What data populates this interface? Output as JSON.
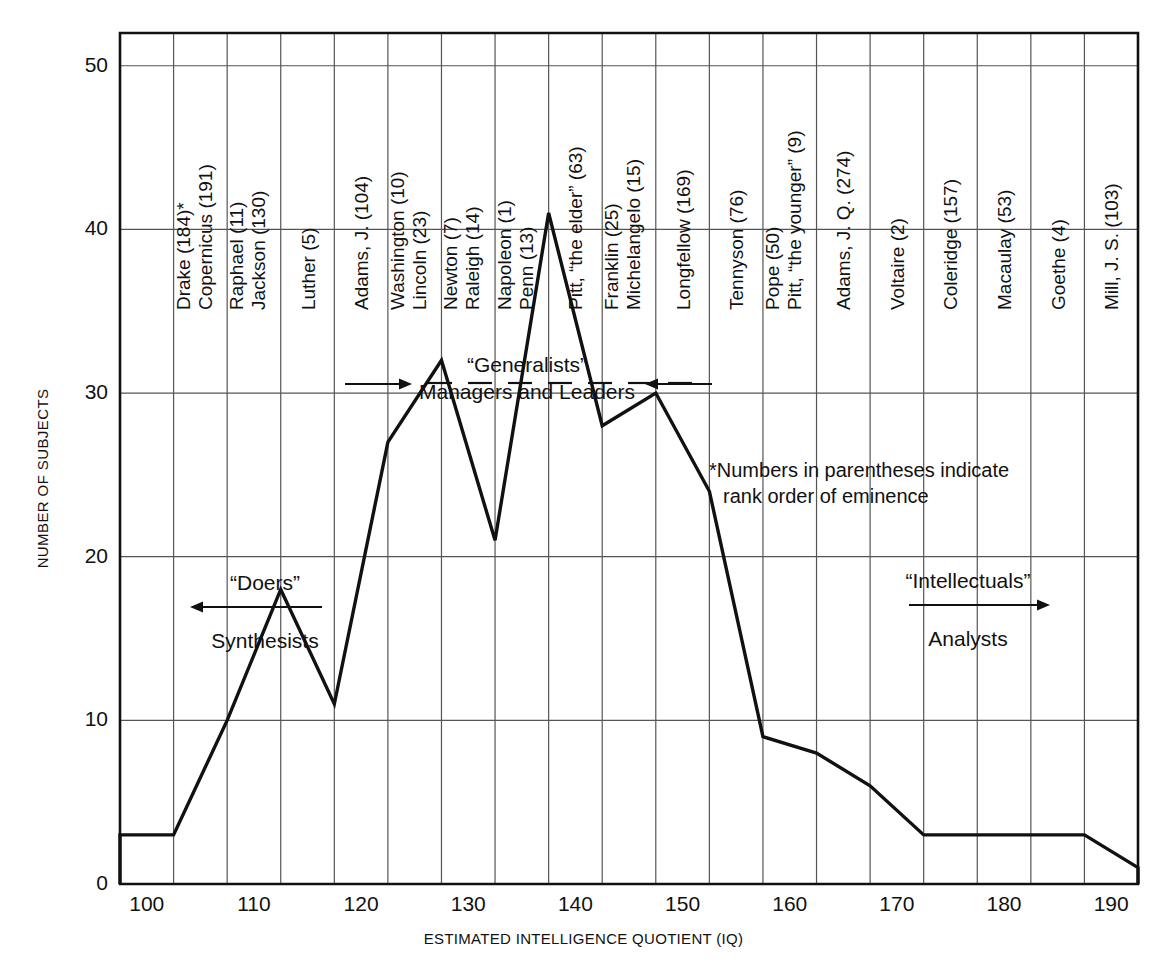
{
  "chart_data": {
    "type": "bar",
    "title": "",
    "xlabel": "ESTIMATED INTELLIGENCE QUOTIENT (IQ)",
    "ylabel": "NUMBER OF SUBJECTS",
    "xlim": [
      97.5,
      192.5
    ],
    "ylim": [
      0,
      52
    ],
    "xticks": [
      100,
      110,
      120,
      130,
      140,
      150,
      160,
      170,
      180,
      190
    ],
    "yticks": [
      0,
      10,
      20,
      30,
      40,
      50
    ],
    "grid": true,
    "legend": "none",
    "bin_width": 5,
    "bin_starts": [
      97.5,
      102.5,
      107.5,
      112.5,
      117.5,
      122.5,
      127.5,
      132.5,
      137.5,
      142.5,
      147.5,
      152.5,
      157.5,
      162.5,
      167.5,
      172.5,
      177.5,
      182.5,
      187.5
    ],
    "values": [
      3,
      10,
      18,
      11,
      27,
      32,
      21,
      41,
      28,
      30,
      24,
      9,
      8,
      6,
      3,
      3,
      3,
      3,
      1
    ]
  },
  "axis": {
    "y_label": "NUMBER OF SUBJECTS",
    "x_label": "ESTIMATED INTELLIGENCE QUOTIENT (IQ)",
    "y_ticks": [
      "0",
      "10",
      "20",
      "30",
      "40",
      "50"
    ],
    "x_ticks": [
      "100",
      "110",
      "120",
      "130",
      "140",
      "150",
      "160",
      "170",
      "180",
      "190"
    ]
  },
  "column_labels": [
    {
      "bin_start": 102.5,
      "lines": [
        "Drake (184)*",
        "Copernicus (191)"
      ]
    },
    {
      "bin_start": 107.5,
      "lines": [
        "Raphael (11)",
        "Jackson (130)"
      ]
    },
    {
      "bin_start": 112.5,
      "lines": [
        "Luther (5)"
      ]
    },
    {
      "bin_start": 117.5,
      "lines": [
        "Adams, J. (104)"
      ]
    },
    {
      "bin_start": 122.5,
      "lines": [
        "Washington (10)",
        "Lincoln (23)"
      ]
    },
    {
      "bin_start": 127.5,
      "lines": [
        "Newton (7)",
        "Raleigh (14)"
      ]
    },
    {
      "bin_start": 132.5,
      "lines": [
        "Napoleon (1)",
        "Penn (13)"
      ]
    },
    {
      "bin_start": 137.5,
      "lines": [
        "Pitt, “the elder” (63)"
      ]
    },
    {
      "bin_start": 142.5,
      "lines": [
        "Franklin (25)",
        "Michelangelo (15)"
      ]
    },
    {
      "bin_start": 147.5,
      "lines": [
        "Longfellow (169)"
      ]
    },
    {
      "bin_start": 152.5,
      "lines": [
        "Tennyson (76)"
      ]
    },
    {
      "bin_start": 157.5,
      "lines": [
        "Pope (50)",
        "Pitt, “the younger” (9)"
      ]
    },
    {
      "bin_start": 162.5,
      "lines": [
        "Adams, J. Q. (274)"
      ]
    },
    {
      "bin_start": 167.5,
      "lines": [
        "Voltaire (2)"
      ]
    },
    {
      "bin_start": 172.5,
      "lines": [
        "Coleridge (157)"
      ]
    },
    {
      "bin_start": 177.5,
      "lines": [
        "Macaulay (53)"
      ]
    },
    {
      "bin_start": 182.5,
      "lines": [
        "Goethe (4)"
      ]
    },
    {
      "bin_start": 187.5,
      "lines": [
        "Mill, J. S. (103)"
      ]
    }
  ],
  "annotations": {
    "generalists": {
      "title": "“Generalists”",
      "subtitle": "Managers and Leaders"
    },
    "doers": {
      "title": "“Doers”",
      "subtitle": "Synthesists"
    },
    "intellectuals": {
      "title": "“Intellectuals”",
      "subtitle": "Analysts"
    },
    "footnote_line1": "*Numbers in parentheses indicate",
    "footnote_line2": "rank order of eminence"
  },
  "colors": {
    "line": "#111111",
    "grid": "#555555",
    "background": "#ffffff"
  }
}
